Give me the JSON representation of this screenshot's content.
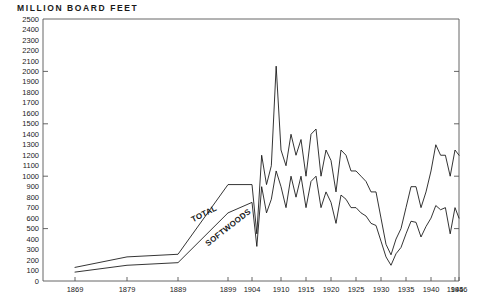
{
  "chart_data": {
    "type": "line",
    "title": "MILLION BOARD FEET",
    "xlabel": "",
    "ylabel": "MILLION BOARD FEET",
    "ylim": [
      0,
      2500
    ],
    "xlim": [
      1869,
      1946
    ],
    "grid": false,
    "legend": "inline-labels",
    "ytick_labels": [
      "2500",
      "2400",
      "2300",
      "2200",
      "2100",
      "2000",
      "1900",
      "1800",
      "1700",
      "1600",
      "1500",
      "1400",
      "1300",
      "1200",
      "1100",
      "1000",
      "900",
      "800",
      "700",
      "600",
      "500",
      "400",
      "300",
      "200",
      "100",
      "0"
    ],
    "ytick_values": [
      2500,
      2400,
      2300,
      2200,
      2100,
      2000,
      1900,
      1800,
      1700,
      1600,
      1500,
      1400,
      1300,
      1200,
      1100,
      1000,
      900,
      800,
      700,
      600,
      500,
      400,
      300,
      200,
      100,
      0
    ],
    "ymajor_ticks": [
      2000,
      1500,
      1000,
      500
    ],
    "xtick_labels": [
      "1869",
      "1879",
      "1889",
      "1899",
      "1904",
      "1910",
      "1915",
      "1920",
      "1925",
      "1930",
      "1935",
      "1940",
      "1945",
      "1946"
    ],
    "xtick_values": [
      1869,
      1879,
      1889,
      1899,
      1904,
      1910,
      1915,
      1920,
      1925,
      1930,
      1935,
      1940,
      1945,
      1946
    ],
    "series": [
      {
        "name": "TOTAL",
        "label": "TOTAL",
        "color": "#111111",
        "x": [
          1869,
          1879,
          1889,
          1899,
          1904,
          1905,
          1906,
          1907,
          1908,
          1909,
          1910,
          1911,
          1912,
          1913,
          1914,
          1915,
          1916,
          1917,
          1918,
          1919,
          1920,
          1921,
          1922,
          1923,
          1924,
          1925,
          1926,
          1927,
          1928,
          1929,
          1930,
          1931,
          1932,
          1933,
          1934,
          1935,
          1936,
          1937,
          1938,
          1939,
          1940,
          1941,
          1942,
          1943,
          1944,
          1945,
          1946
        ],
        "values": [
          130,
          230,
          255,
          920,
          920,
          450,
          1200,
          920,
          1100,
          2050,
          1250,
          1100,
          1400,
          1200,
          1350,
          1000,
          1400,
          1450,
          1000,
          1250,
          1150,
          850,
          1250,
          1200,
          1050,
          1050,
          1000,
          950,
          850,
          850,
          600,
          350,
          250,
          400,
          500,
          700,
          900,
          900,
          700,
          850,
          1050,
          1300,
          1200,
          1200,
          1000,
          1250,
          1200
        ]
      },
      {
        "name": "SOFTWOODS",
        "label": "SOFTWOODS",
        "color": "#111111",
        "x": [
          1869,
          1879,
          1889,
          1899,
          1904,
          1905,
          1906,
          1907,
          1908,
          1909,
          1910,
          1911,
          1912,
          1913,
          1914,
          1915,
          1916,
          1917,
          1918,
          1919,
          1920,
          1921,
          1922,
          1923,
          1924,
          1925,
          1926,
          1927,
          1928,
          1929,
          1930,
          1931,
          1932,
          1933,
          1934,
          1935,
          1936,
          1937,
          1938,
          1939,
          1940,
          1941,
          1942,
          1943,
          1944,
          1945,
          1946
        ],
        "values": [
          85,
          150,
          175,
          650,
          750,
          330,
          900,
          650,
          780,
          1050,
          900,
          700,
          1000,
          800,
          1000,
          700,
          950,
          1000,
          700,
          850,
          750,
          550,
          820,
          780,
          700,
          700,
          650,
          620,
          550,
          530,
          380,
          230,
          150,
          260,
          320,
          450,
          570,
          560,
          420,
          520,
          600,
          720,
          680,
          700,
          450,
          700,
          600
        ]
      }
    ],
    "annotations": [
      {
        "text": "TOTAL",
        "x": 1892,
        "y": 560,
        "rotation": -27
      },
      {
        "text": "SOFTWOODS",
        "x": 1895,
        "y": 330,
        "rotation": -38
      }
    ]
  }
}
